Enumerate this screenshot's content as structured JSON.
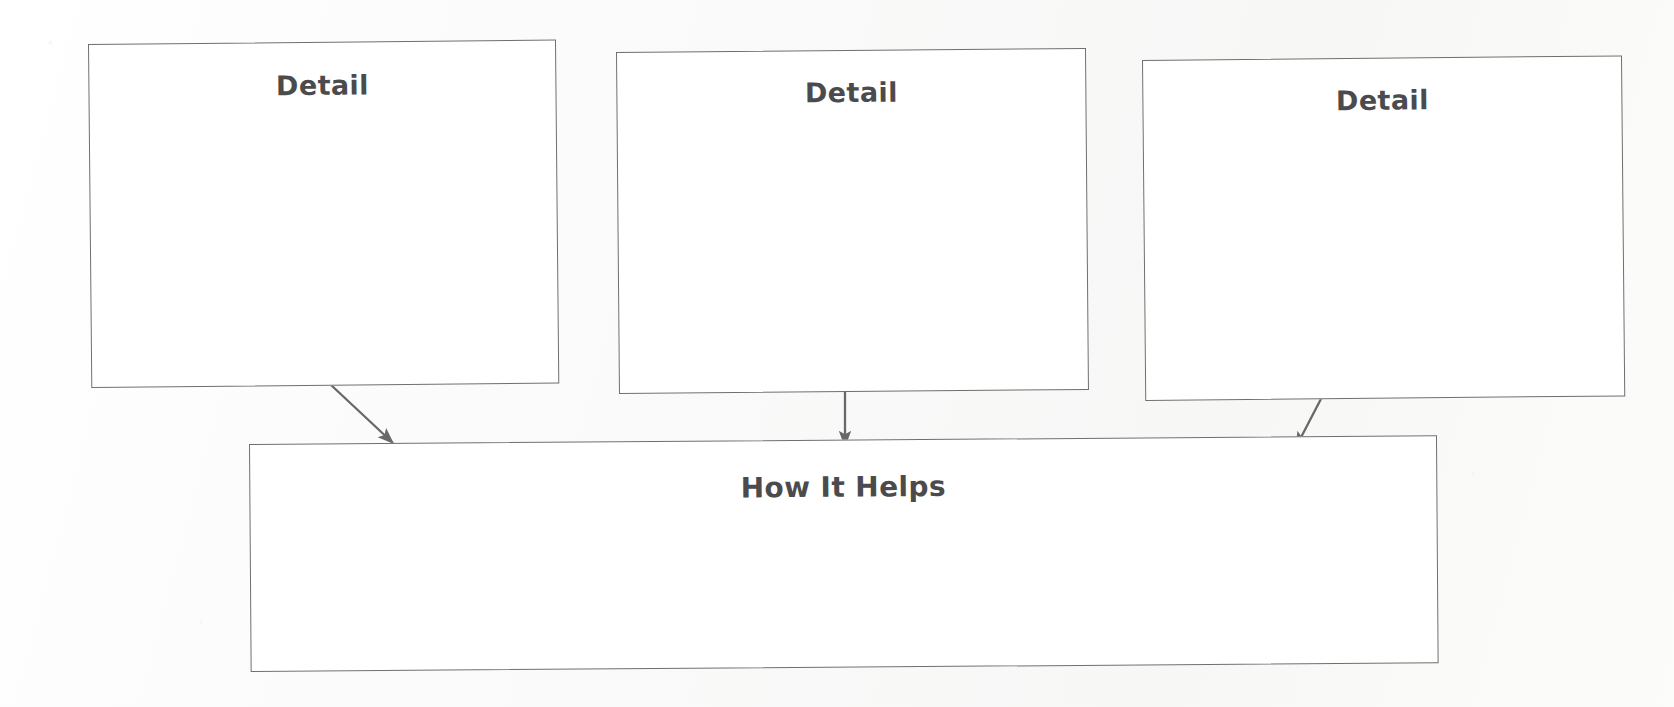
{
  "diagram": {
    "background_color": "#fbfbfa",
    "stroke_color": "#6f6f70",
    "text_color": "#4b4b4d",
    "nodes": [
      {
        "id": "detail-1",
        "label": "Detail",
        "body_text": ""
      },
      {
        "id": "detail-2",
        "label": "Detail",
        "body_text": ""
      },
      {
        "id": "detail-3",
        "label": "Detail",
        "body_text": ""
      },
      {
        "id": "how-it-helps",
        "label": "How It Helps",
        "body_text": ""
      }
    ],
    "connectors": [
      {
        "id": "arrow-detail-1-to-how-it-helps",
        "from": "detail-1",
        "to": "how-it-helps",
        "direction": "down-right"
      },
      {
        "id": "arrow-detail-2-to-how-it-helps",
        "from": "detail-2",
        "to": "how-it-helps",
        "direction": "down"
      },
      {
        "id": "arrow-detail-3-to-how-it-helps",
        "from": "detail-3",
        "to": "how-it-helps",
        "direction": "down-left"
      }
    ]
  }
}
